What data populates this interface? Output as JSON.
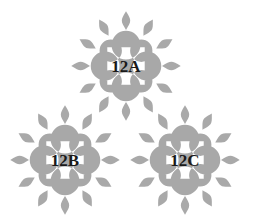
{
  "figure": {
    "background_color": "#ffffff",
    "width": 253,
    "height": 224,
    "motif_fill": "#a8a8a8",
    "petal_fill": "#a9a9a9",
    "label_color": "#1a1a1a",
    "petal_count_per_motif": 12,
    "motifs": [
      {
        "id": "motif-top",
        "label": "12A",
        "center_x": 126,
        "center_y": 66,
        "scale": 1.0
      },
      {
        "id": "motif-bottom-left",
        "label": "12B",
        "center_x": 65,
        "center_y": 160,
        "scale": 1.0
      },
      {
        "id": "motif-bottom-right",
        "label": "12C",
        "center_x": 185,
        "center_y": 160,
        "scale": 1.0
      }
    ]
  }
}
